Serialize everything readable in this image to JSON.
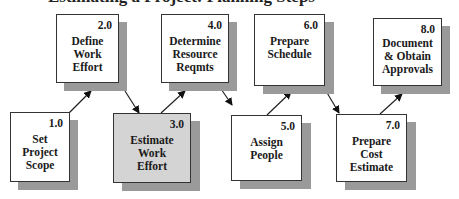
{
  "title": "Estimating a Project: Planning Steps",
  "nodes": [
    {
      "id": "1.0",
      "label_lines": [
        "Set",
        "Project",
        "Scope"
      ],
      "highlight": false
    },
    {
      "id": "2.0",
      "label_lines": [
        "Define",
        "Work",
        "Effort"
      ],
      "highlight": false
    },
    {
      "id": "3.0",
      "label_lines": [
        "Estimate",
        "Work",
        "Effort"
      ],
      "highlight": true
    },
    {
      "id": "4.0",
      "label_lines": [
        "Determine",
        "Resource",
        "Reqmts"
      ],
      "highlight": false
    },
    {
      "id": "5.0",
      "label_lines": [
        "Assign",
        "People"
      ],
      "highlight": false
    },
    {
      "id": "6.0",
      "label_lines": [
        "Prepare",
        "Schedule"
      ],
      "highlight": false
    },
    {
      "id": "7.0",
      "label_lines": [
        "Prepare",
        "Cost",
        "Estimate"
      ],
      "highlight": false
    },
    {
      "id": "8.0",
      "label_lines": [
        "Document",
        "& Obtain",
        "Approvals"
      ],
      "highlight": false
    }
  ],
  "edges": [
    {
      "from": "1.0",
      "to": "2.0"
    },
    {
      "from": "2.0",
      "to": "3.0"
    },
    {
      "from": "3.0",
      "to": "4.0"
    },
    {
      "from": "4.0",
      "to": "5.0"
    },
    {
      "from": "5.0",
      "to": "6.0"
    },
    {
      "from": "6.0",
      "to": "7.0"
    },
    {
      "from": "7.0",
      "to": "8.0"
    }
  ],
  "colors": {
    "box_fill": "#ffffff",
    "highlight_fill": "#d4d4d4",
    "shadow": "#9a9a9a",
    "stroke": "#333333"
  }
}
